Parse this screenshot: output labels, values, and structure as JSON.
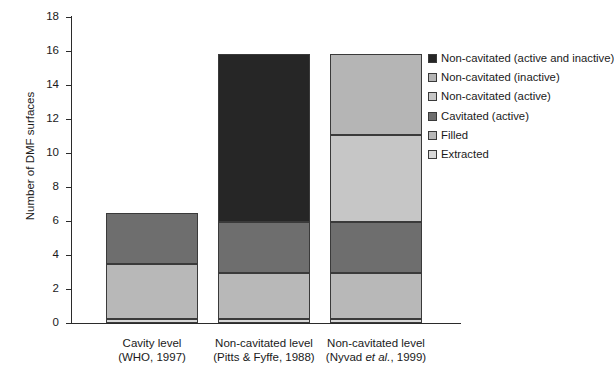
{
  "chart_data": {
    "type": "bar",
    "stacked": true,
    "title": "",
    "subtitle": "",
    "xlabel": "",
    "ylabel": "Number of DMF surfaces",
    "ylim": [
      0,
      18
    ],
    "yticks": [
      0,
      2,
      4,
      6,
      8,
      10,
      12,
      14,
      16,
      18
    ],
    "ytick_labels": [
      "0",
      "2",
      "4",
      "6",
      "8",
      "10",
      "12",
      "14",
      "16",
      "18"
    ],
    "grid": false,
    "legend_position": "right",
    "categories": [
      "Cavity level (WHO, 1997)",
      "Non-cavitated level (Pitts & Fyffe, 1988)",
      "Non-cavitated level (Nyvad et al., 1999)"
    ],
    "category_labels": [
      {
        "line1": "Cavity level",
        "line2": "(WHO, 1997)",
        "italic": ""
      },
      {
        "line1": "Non-cavitated level",
        "line2": "(Pitts & Fyffe, 1988)",
        "italic": ""
      },
      {
        "line1": "Non-cavitated level",
        "line2_pre": "(Nyvad ",
        "italic": "et al.",
        "line2_post": ", 1999)"
      }
    ],
    "series": [
      {
        "name": "Extracted",
        "color": "#d8d8d8",
        "values": [
          0.25,
          0.25,
          0.25
        ]
      },
      {
        "name": "Filled",
        "color": "#b8b8b8",
        "values": [
          3.2,
          2.7,
          2.7
        ]
      },
      {
        "name": "Cavitated (active)",
        "color": "#6e6e6e",
        "values": [
          3.05,
          3.0,
          3.0
        ]
      },
      {
        "name": "Non-cavitated (active)",
        "color": "#c6c6c6",
        "values": [
          0,
          0,
          5.1
        ]
      },
      {
        "name": "Non-cavitated (inactive)",
        "color": "#b5b5b5",
        "values": [
          0,
          0,
          4.75
        ]
      },
      {
        "name": "Non-cavitated (active and inactive)",
        "color": "#262626",
        "values": [
          0,
          9.85,
          0
        ]
      }
    ],
    "totals": [
      6.5,
      15.8,
      15.8
    ],
    "legend": [
      {
        "label": "Non-cavitated (active and inactive)",
        "color": "#262626"
      },
      {
        "label": "Non-cavitated (inactive)",
        "color": "#b5b5b5"
      },
      {
        "label": "Non-cavitated (active)",
        "color": "#c6c6c6"
      },
      {
        "label": "Cavitated (active)",
        "color": "#6e6e6e"
      },
      {
        "label": "Filled",
        "color": "#b8b8b8"
      },
      {
        "label": "Extracted",
        "color": "#d8d8d8"
      }
    ],
    "bars": [
      {
        "category": "Cavity level (WHO, 1997)",
        "segments": [
          {
            "name": "Extracted",
            "from": 0.0,
            "to": 0.25,
            "color": "#d8d8d8"
          },
          {
            "name": "Filled",
            "from": 0.25,
            "to": 3.45,
            "color": "#b8b8b8"
          },
          {
            "name": "Cavitated (active)",
            "from": 3.45,
            "to": 6.5,
            "color": "#6e6e6e"
          }
        ]
      },
      {
        "category": "Non-cavitated level (Pitts & Fyffe, 1988)",
        "segments": [
          {
            "name": "Extracted",
            "from": 0.0,
            "to": 0.25,
            "color": "#d8d8d8"
          },
          {
            "name": "Filled",
            "from": 0.25,
            "to": 2.95,
            "color": "#b8b8b8"
          },
          {
            "name": "Cavitated (active)",
            "from": 2.95,
            "to": 5.95,
            "color": "#6e6e6e"
          },
          {
            "name": "Non-cavitated (active and inactive)",
            "from": 5.95,
            "to": 15.8,
            "color": "#262626"
          }
        ]
      },
      {
        "category": "Non-cavitated level (Nyvad et al., 1999)",
        "segments": [
          {
            "name": "Extracted",
            "from": 0.0,
            "to": 0.25,
            "color": "#d8d8d8"
          },
          {
            "name": "Filled",
            "from": 0.25,
            "to": 2.95,
            "color": "#b8b8b8"
          },
          {
            "name": "Cavitated (active)",
            "from": 2.95,
            "to": 5.95,
            "color": "#6e6e6e"
          },
          {
            "name": "Non-cavitated (active)",
            "from": 5.95,
            "to": 11.05,
            "color": "#c6c6c6"
          },
          {
            "name": "Non-cavitated (inactive)",
            "from": 11.05,
            "to": 15.8,
            "color": "#b5b5b5"
          }
        ]
      }
    ]
  },
  "colors": {
    "axis": "#2b2b2b",
    "text": "#1a1a1a",
    "background": "#ffffff",
    "segment_border": "#3a3a3a"
  }
}
